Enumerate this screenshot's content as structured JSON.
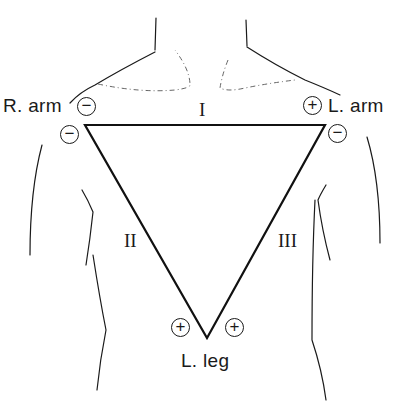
{
  "diagram": {
    "colors": {
      "ink": "#1a1a1a",
      "background": "#ffffff",
      "dashed_contour": "#555555"
    },
    "limbs": {
      "right_arm": {
        "label": "R. arm"
      },
      "left_arm": {
        "label": "L. arm"
      },
      "left_leg": {
        "label": "L. leg"
      }
    },
    "leads": {
      "lead_1": {
        "label": "I",
        "negative": "right_arm",
        "positive": "left_arm"
      },
      "lead_2": {
        "label": "II",
        "negative": "right_arm",
        "positive": "left_leg"
      },
      "lead_3": {
        "label": "III",
        "negative": "left_arm",
        "positive": "left_leg"
      }
    },
    "poles": {
      "lead1_neg": "−",
      "lead1_pos": "+",
      "lead2_neg": "−",
      "lead3_neg": "−",
      "lead2_pos": "+",
      "lead3_pos": "+"
    },
    "triangle_vertices": {
      "right_arm": [
        85,
        125
      ],
      "left_arm": [
        325,
        125
      ],
      "left_leg": [
        207,
        338
      ]
    }
  }
}
